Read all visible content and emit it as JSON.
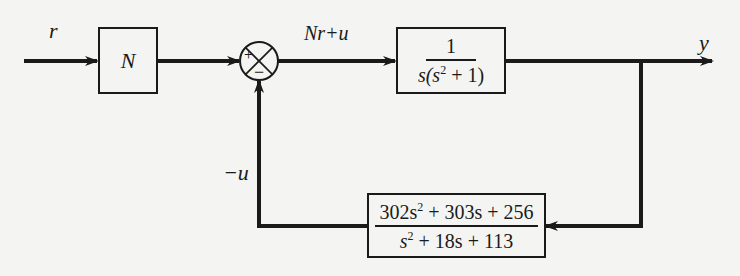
{
  "diagram": {
    "type": "feedback-block-diagram",
    "signals": {
      "input": "r",
      "summed": "Nr+u",
      "output": "y",
      "feedback": "−u"
    },
    "blocks": {
      "gain": {
        "label": "N"
      },
      "plant": {
        "numerator": "1",
        "denominator_prefix": "s(s",
        "denominator_exp": "2",
        "denominator_suffix": " + 1)"
      },
      "controller": {
        "num_a": "302s",
        "num_a_exp": "2",
        "num_rest": " + 303s + 256",
        "den_a": "s",
        "den_a_exp": "2",
        "den_rest": " + 18s + 113"
      }
    },
    "summing_junction": {
      "plus_sign": "+",
      "minus_sign": "−"
    },
    "colors": {
      "line": "#1a1a1a",
      "background": "#f4f4f2"
    }
  }
}
